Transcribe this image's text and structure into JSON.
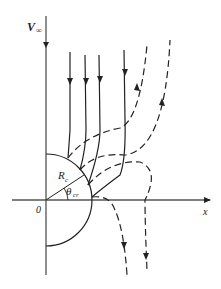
{
  "diagram": {
    "type": "flow-streamlines-around-cylinder",
    "labels": {
      "freestream": "V",
      "freestream_sub": "∞",
      "radius": "R",
      "radius_sub": "c",
      "angle": "θ",
      "angle_sub": "cr",
      "origin": "0",
      "x_axis": "x"
    },
    "colors": {
      "stroke": "#222222",
      "axis": "#555555",
      "background": "#ffffff"
    },
    "legend": {
      "solid": "incoming streamlines (downward)",
      "dashed": "deflected streamlines"
    }
  }
}
